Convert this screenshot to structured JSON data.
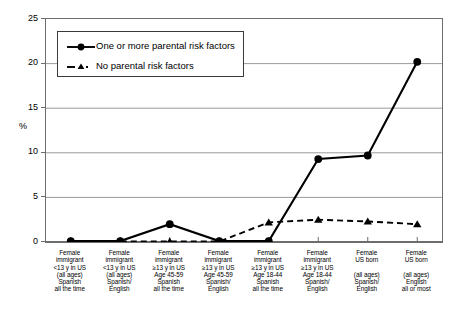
{
  "chart_data": {
    "type": "line",
    "title": "",
    "xlabel": "",
    "ylabel": "%",
    "ylim": [
      0,
      25
    ],
    "yticks": [
      0,
      5,
      10,
      15,
      20,
      25
    ],
    "grid": true,
    "legend_position": "upper-left-inside",
    "categories": [
      "Female immigrant <13 y in US (all ages) Spanish all the time",
      "Female immigrant <13 y in US (all ages) Spanish/ English",
      "Female immigrant ≥13 y in US Age 45-59 Spanish all the time",
      "Female immigrant ≥13 y in US Age 45-59 Spanish/ English",
      "Female immigrant ≥13 y in US Age 18-44 Spanish all the time",
      "Female immigrant ≥13 y in US Age 18-44 Spanish/ English",
      "Female US born (all ages) Spanish/ English",
      "Female US born (all ages) English all or most"
    ],
    "category_lines": [
      [
        "Female",
        "immigrant",
        "<13 y in US",
        "(all ages)",
        "Spanish",
        "all the time"
      ],
      [
        "Female",
        "immigrant",
        "<13 y in US",
        "(all ages)",
        "Spanish/",
        "English"
      ],
      [
        "Female",
        "immigrant",
        "≥13 y in US",
        "Age 45-59",
        "Spanish",
        "all the time"
      ],
      [
        "Female",
        "immigrant",
        "≥13 y in US",
        "Age 45-59",
        "Spanish/",
        "English"
      ],
      [
        "Female",
        "immigrant",
        "≥13 y in US",
        "Age 18-44",
        "Spanish",
        "all the time"
      ],
      [
        "Female",
        "immigrant",
        "≥13 y in US",
        "Age 18-44",
        "Spanish/",
        "English"
      ],
      [
        "Female",
        "US born",
        "",
        "(all ages)",
        "Spanish/",
        "English"
      ],
      [
        "Female",
        "US born",
        "",
        "(all ages)",
        "English",
        "all or most"
      ]
    ],
    "series": [
      {
        "name": "One or more parental risk factors",
        "marker": "circle",
        "linestyle": "solid",
        "color": "#000000",
        "values": [
          0.1,
          0.1,
          2.0,
          0.1,
          0.1,
          9.3,
          9.7,
          20.2
        ]
      },
      {
        "name": "No parental risk factors",
        "marker": "triangle",
        "linestyle": "dashed",
        "color": "#000000",
        "values": [
          0.05,
          0.05,
          0.05,
          0.05,
          2.2,
          2.5,
          2.3,
          2.0
        ]
      }
    ]
  },
  "legend": {
    "items": [
      {
        "label": "One or more parental risk factors"
      },
      {
        "label": "No parental risk factors"
      }
    ]
  },
  "axis": {
    "y_title": "%",
    "y_ticks": [
      "0",
      "5",
      "10",
      "15",
      "20",
      "25"
    ]
  }
}
